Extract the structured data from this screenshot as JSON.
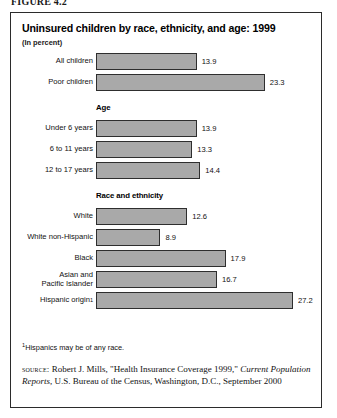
{
  "figure_label": "FIGURE 4.2",
  "chart_data": {
    "type": "bar",
    "orientation": "horizontal",
    "title": "Uninsured children by race, ethnicity, and age: 1999",
    "subtitle": "(In percent)",
    "xlabel": "",
    "ylabel": "",
    "xlim": [
      0,
      27.2
    ],
    "grid": false,
    "legend": "none",
    "bar_color": "#a9a9a9",
    "bar_border_color": "#2e2e2e",
    "categories": [
      "All children",
      "Poor children",
      "Under 6 years",
      "6 to 11 years",
      "12 to 17 years",
      "White",
      "White non-Hispanic",
      "Black",
      "Asian and Pacific Islander",
      "Hispanic origin"
    ],
    "values": [
      13.9,
      23.3,
      13.9,
      13.3,
      14.4,
      12.6,
      8.9,
      17.9,
      16.7,
      27.2
    ],
    "sections": [
      {
        "head": "",
        "rows": [
          0,
          1
        ]
      },
      {
        "head": "Age",
        "rows": [
          2,
          3,
          4
        ]
      },
      {
        "head": "Race and ethnicity",
        "rows": [
          5,
          6,
          7,
          8,
          9
        ]
      }
    ],
    "rows": [
      {
        "label": "All children",
        "value": 13.9,
        "value_text": "13.9",
        "section": ""
      },
      {
        "label": "Poor children",
        "value": 23.3,
        "value_text": "23.3",
        "section": ""
      },
      {
        "label": "Under 6 years",
        "value": 13.9,
        "value_text": "13.9",
        "section": "Age"
      },
      {
        "label": "6 to 11 years",
        "value": 13.3,
        "value_text": "13.3",
        "section": "Age"
      },
      {
        "label": "12 to 17 years",
        "value": 14.4,
        "value_text": "14.4",
        "section": "Age"
      },
      {
        "label": "White",
        "value": 12.6,
        "value_text": "12.6",
        "section": "Race and ethnicity"
      },
      {
        "label": "White non-Hispanic",
        "value": 8.9,
        "value_text": "8.9",
        "section": "Race and ethnicity"
      },
      {
        "label": "Black",
        "value": 17.9,
        "value_text": "17.9",
        "section": "Race and ethnicity"
      },
      {
        "label": "Asian and\nPacific Islander",
        "value": 16.7,
        "value_text": "16.7",
        "section": "Race and ethnicity"
      },
      {
        "label": "Hispanic origin",
        "value": 27.2,
        "value_text": "27.2",
        "section": "Race and ethnicity",
        "footnote_marker": "1"
      }
    ],
    "section_headings": {
      "age": "Age",
      "race": "Race and ethnicity"
    }
  },
  "footnote": {
    "marker": "1",
    "text": "Hispanics may be of any race."
  },
  "source": {
    "tag": "SOURCE:",
    "part1": " Robert J. Mills, \"Health Insurance Coverage 1999,\" ",
    "italic1": "Current Population Reports",
    "part2": ", U.S. Bureau of the Census, Washington, D.C., September 2000"
  }
}
